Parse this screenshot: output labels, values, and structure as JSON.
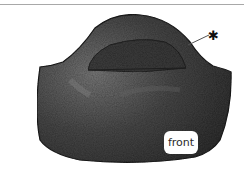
{
  "illustration": {
    "subject": "pencil-shaded fabric pocket/bag front panel",
    "label_text": "front",
    "marker_symbol": "*"
  },
  "colors": {
    "fill_dark": "#3a3a3a",
    "fill_mid": "#5a5a5a",
    "highlight": "#8a8a8a",
    "rule": "#a8a8a8",
    "background": "#ffffff"
  }
}
